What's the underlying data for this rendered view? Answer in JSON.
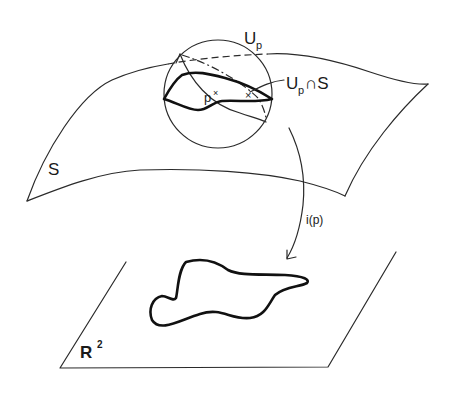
{
  "diagram": {
    "labels": {
      "neighborhood": "U",
      "neighborhood_sub": "p",
      "intersection_main": "U",
      "intersection_sub": "p",
      "intersection_rest": "∩S",
      "surface": "S",
      "point": "p",
      "point_mark": "×",
      "map": "i(p)",
      "plane_main": "R",
      "plane_sup": "2"
    },
    "colors": {
      "stroke": "#2a2a2a",
      "background": "#ffffff"
    },
    "elements": [
      {
        "id": "surface-S",
        "type": "curved-sheet",
        "label": "S"
      },
      {
        "id": "ball-Up",
        "type": "circle",
        "label": "Up",
        "center": [
          218,
          94
        ],
        "radius": 54
      },
      {
        "id": "curve-Up-cap-S",
        "type": "closed-curve",
        "label": "Up ∩ S"
      },
      {
        "id": "arrow-i-p",
        "type": "curved-arrow",
        "label": "i(p)"
      },
      {
        "id": "plane-R2",
        "type": "parallelogram",
        "label": "R²"
      },
      {
        "id": "image-curve",
        "type": "closed-curve"
      }
    ]
  }
}
